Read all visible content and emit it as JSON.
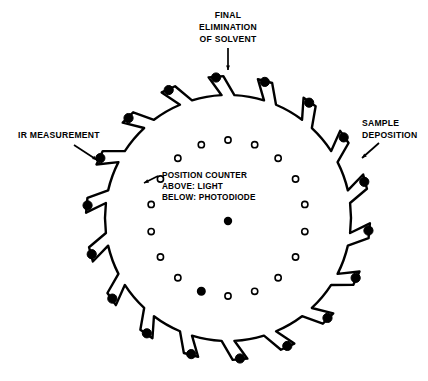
{
  "figure": {
    "background_color": "#ffffff",
    "ink_color": "#000000",
    "width": 428,
    "height": 381
  },
  "disc": {
    "center_x": 228,
    "center_y": 218,
    "radius": 123,
    "tab_count": 18,
    "tab_description": "radial sample-holder arm with filled cap",
    "stroke_width": 2.4
  },
  "position_ring": {
    "count": 18,
    "radius": 78,
    "hole_radius": 3.1,
    "marked_index": 10,
    "marked_style": "filled",
    "unmarked_style": "hollow"
  },
  "center_marker": {
    "radius": 4.2,
    "style": "filled"
  },
  "labels": {
    "final_elimination": {
      "lines": [
        "FINAL",
        "ELIMINATION",
        "OF SOLVENT"
      ],
      "x": 228,
      "y": 18,
      "align": "middle",
      "arrow": "down"
    },
    "ir_measurement": {
      "lines": [
        "IR MEASUREMENT"
      ],
      "x": 18,
      "y": 138,
      "align": "start",
      "arrow": "down-right"
    },
    "sample_deposition": {
      "lines": [
        "SAMPLE",
        "DEPOSITION"
      ],
      "x": 362,
      "y": 126,
      "align": "start",
      "arrow": "down-left"
    },
    "position_counter": {
      "lines": [
        "POSITION COUNTER",
        "ABOVE: LIGHT",
        "BELOW: PHOTODIODE"
      ],
      "x": 162,
      "y": 178,
      "align": "start",
      "arrow": "left"
    }
  },
  "annotations": {
    "arrow_stroke_width": 1.7,
    "arrow_head_size": 5
  }
}
